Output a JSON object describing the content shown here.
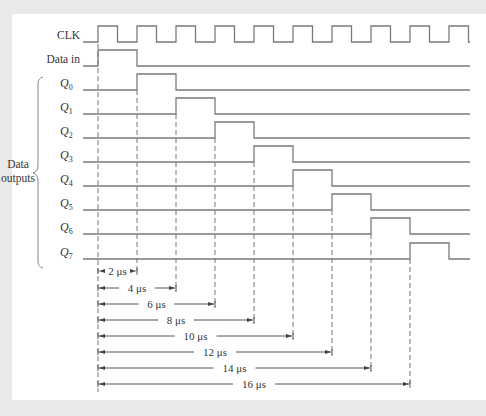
{
  "diagram": {
    "title": "",
    "colors": {
      "background": "#e9e9e9",
      "panel": "#ffffff",
      "signal": "#7a7a7a",
      "text": "#333333"
    },
    "timing": {
      "t0_x": 98,
      "period_px": 39,
      "line_start_x": 83,
      "line_end_x": 470
    },
    "signals": [
      {
        "name": "CLK",
        "label": "CLK",
        "y_low": 42,
        "y_high": 26,
        "type": "clock"
      },
      {
        "name": "data-in",
        "label": "Data in",
        "y_low": 66,
        "y_high": 50,
        "type": "pulse",
        "start_period": 0
      },
      {
        "name": "q0",
        "label": "Q",
        "sub": "0",
        "y_low": 90,
        "y_high": 74,
        "type": "pulse",
        "start_period": 1
      },
      {
        "name": "q1",
        "label": "Q",
        "sub": "1",
        "y_low": 114,
        "y_high": 98,
        "type": "pulse",
        "start_period": 2
      },
      {
        "name": "q2",
        "label": "Q",
        "sub": "2",
        "y_low": 138,
        "y_high": 122,
        "type": "pulse",
        "start_period": 3
      },
      {
        "name": "q3",
        "label": "Q",
        "sub": "3",
        "y_low": 162,
        "y_high": 146,
        "type": "pulse",
        "start_period": 4
      },
      {
        "name": "q4",
        "label": "Q",
        "sub": "4",
        "y_low": 186,
        "y_high": 170,
        "type": "pulse",
        "start_period": 5
      },
      {
        "name": "q5",
        "label": "Q",
        "sub": "5",
        "y_low": 210,
        "y_high": 194,
        "type": "pulse",
        "start_period": 6
      },
      {
        "name": "q6",
        "label": "Q",
        "sub": "6",
        "y_low": 234,
        "y_high": 218,
        "type": "pulse",
        "start_period": 7
      },
      {
        "name": "q7",
        "label": "Q",
        "sub": "7",
        "y_low": 259,
        "y_high": 243,
        "type": "pulse",
        "start_period": 8
      }
    ],
    "group_label": [
      "Data",
      "outputs"
    ],
    "dimensions": [
      {
        "label": "2 μs",
        "periods": 1,
        "y": 271
      },
      {
        "label": "4 μs",
        "periods": 2,
        "y": 288
      },
      {
        "label": "6 μs",
        "periods": 3,
        "y": 304
      },
      {
        "label": "8 μs",
        "periods": 4,
        "y": 320
      },
      {
        "label": "10 μs",
        "periods": 5,
        "y": 336
      },
      {
        "label": "12 μs",
        "periods": 6,
        "y": 352
      },
      {
        "label": "14 μs",
        "periods": 7,
        "y": 368
      },
      {
        "label": "16 μs",
        "periods": 8,
        "y": 384
      }
    ]
  }
}
